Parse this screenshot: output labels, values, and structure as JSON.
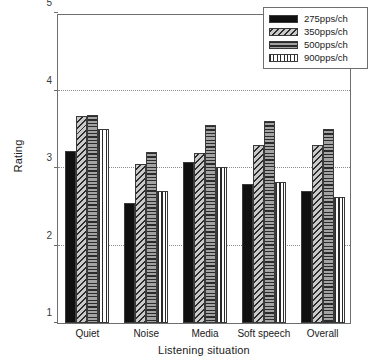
{
  "chart_data": {
    "type": "bar",
    "title": "",
    "xlabel": "Listening situation",
    "ylabel": "Rating",
    "categories": [
      "Quiet",
      "Noise",
      "Media",
      "Soft speech",
      "Overall"
    ],
    "series": [
      {
        "name": "275pps/ch",
        "pattern": "solid-black",
        "values": [
          3.22,
          2.55,
          3.08,
          2.8,
          2.7
        ]
      },
      {
        "name": "350pps/ch",
        "pattern": "diagonal-hatch",
        "values": [
          3.67,
          3.05,
          3.2,
          3.3,
          3.3
        ]
      },
      {
        "name": "500pps/ch",
        "pattern": "horizontal-lines",
        "values": [
          3.68,
          3.21,
          3.55,
          3.61,
          3.5
        ]
      },
      {
        "name": "900pps/ch",
        "pattern": "vertical-lines",
        "values": [
          3.5,
          2.7,
          3.01,
          2.82,
          2.62
        ]
      }
    ],
    "ylim": [
      1,
      5
    ],
    "yticks": [
      "1",
      "2",
      "3",
      "4",
      "5"
    ],
    "ytick_values": [
      1,
      2,
      3,
      4,
      5
    ],
    "gridlines_at": [
      2,
      3,
      4
    ],
    "grid": true,
    "legend_position": "top-right"
  },
  "legend": {
    "entries": [
      {
        "label": "275pps/ch"
      },
      {
        "label": "350pps/ch"
      },
      {
        "label": "500pps/ch"
      },
      {
        "label": "900pps/ch"
      }
    ]
  }
}
